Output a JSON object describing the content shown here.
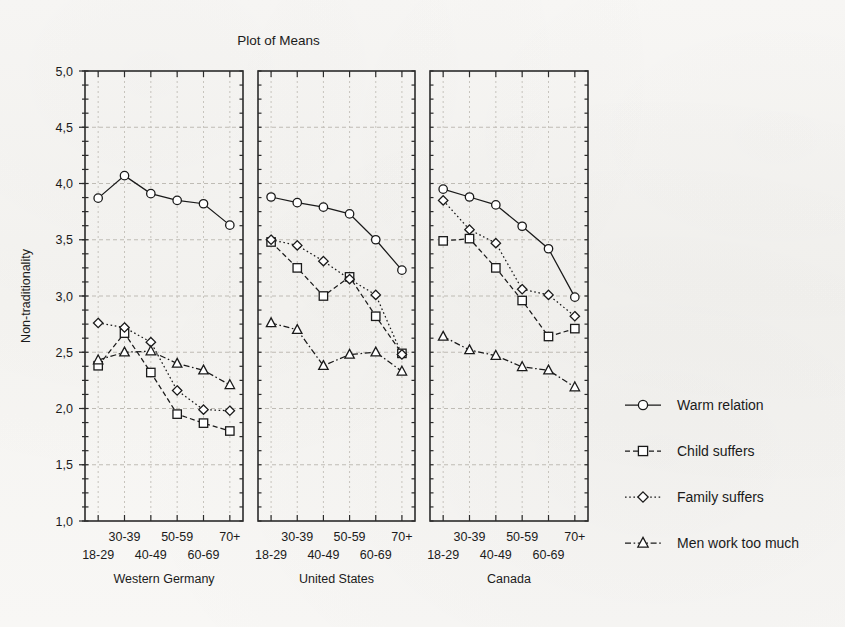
{
  "chart_data": {
    "type": "line",
    "title": "Plot of Means",
    "xlabel": "",
    "ylabel": "Non-traditionality",
    "ylim": [
      1.0,
      5.0
    ],
    "ytick_step": 0.5,
    "ytick_labels": [
      "1,0",
      "1,5",
      "2,0",
      "2,5",
      "3,0",
      "3,5",
      "4,0",
      "4,5",
      "5,0"
    ],
    "ytick_values": [
      1.0,
      1.5,
      2.0,
      2.5,
      3.0,
      3.5,
      4.0,
      4.5,
      5.0
    ],
    "decimal_separator": ",",
    "grid": true,
    "legend_position": "right",
    "categories": [
      "18-29",
      "30-39",
      "40-49",
      "50-59",
      "60-69",
      "70+"
    ],
    "panel_variable": "Country",
    "panels": [
      {
        "name": "Western Germany",
        "series": [
          {
            "name": "Warm relation",
            "marker": "circle",
            "linestyle": "solid",
            "values": [
              3.87,
              4.07,
              3.91,
              3.85,
              3.82,
              3.63
            ]
          },
          {
            "name": "Child suffers",
            "marker": "square",
            "linestyle": "dashed",
            "values": [
              2.38,
              2.67,
              2.32,
              1.95,
              1.87,
              1.8
            ]
          },
          {
            "name": "Family suffers",
            "marker": "diamond",
            "linestyle": "dotted",
            "values": [
              2.76,
              2.72,
              2.59,
              2.16,
              1.99,
              1.98
            ]
          },
          {
            "name": "Men work too much",
            "marker": "triangle",
            "linestyle": "dash-dot",
            "values": [
              2.43,
              2.5,
              2.51,
              2.4,
              2.34,
              2.21
            ]
          }
        ]
      },
      {
        "name": "United States",
        "series": [
          {
            "name": "Warm relation",
            "marker": "circle",
            "linestyle": "solid",
            "values": [
              3.88,
              3.83,
              3.79,
              3.73,
              3.5,
              3.23
            ]
          },
          {
            "name": "Child suffers",
            "marker": "square",
            "linestyle": "dashed",
            "values": [
              3.48,
              3.25,
              3.0,
              3.17,
              2.82,
              2.49
            ]
          },
          {
            "name": "Family suffers",
            "marker": "diamond",
            "linestyle": "dotted",
            "values": [
              3.5,
              3.45,
              3.31,
              3.15,
              3.01,
              2.48
            ]
          },
          {
            "name": "Men work too much",
            "marker": "triangle",
            "linestyle": "dash-dot",
            "values": [
              2.76,
              2.7,
              2.38,
              2.48,
              2.5,
              2.33
            ]
          }
        ]
      },
      {
        "name": "Canada",
        "series": [
          {
            "name": "Warm relation",
            "marker": "circle",
            "linestyle": "solid",
            "values": [
              3.95,
              3.88,
              3.81,
              3.62,
              3.42,
              2.99
            ]
          },
          {
            "name": "Child suffers",
            "marker": "square",
            "linestyle": "dashed",
            "values": [
              3.49,
              3.51,
              3.25,
              2.96,
              2.64,
              2.71
            ]
          },
          {
            "name": "Family suffers",
            "marker": "diamond",
            "linestyle": "dotted",
            "values": [
              3.85,
              3.59,
              3.47,
              3.06,
              3.01,
              2.82
            ]
          },
          {
            "name": "Men work too much",
            "marker": "triangle",
            "linestyle": "dash-dot",
            "values": [
              2.64,
              2.52,
              2.47,
              2.37,
              2.34,
              2.19
            ]
          }
        ]
      }
    ],
    "legend": [
      {
        "label": "Warm relation",
        "marker": "circle",
        "linestyle": "solid"
      },
      {
        "label": "Child suffers",
        "marker": "square",
        "linestyle": "dashed"
      },
      {
        "label": "Family suffers",
        "marker": "diamond",
        "linestyle": "dotted"
      },
      {
        "label": "Men work too much",
        "marker": "triangle",
        "linestyle": "dash-dot"
      }
    ],
    "colors": {
      "line": "#1a1a1a",
      "marker_fill": "#ffffff",
      "grid": "#b9b5ae",
      "frame": "#2b2b2b",
      "background": "#f7f6f4"
    }
  }
}
